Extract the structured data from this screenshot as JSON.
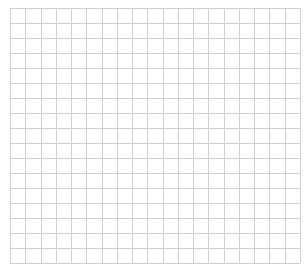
{
  "canvas": {
    "width": 307,
    "height": 271,
    "background": "#ffffff"
  },
  "grid": {
    "left": 10,
    "top": 8,
    "right": 300,
    "bottom": 263,
    "columns": 19,
    "rows": 17,
    "line_color": "#cfcfcf",
    "line_width": 1
  }
}
